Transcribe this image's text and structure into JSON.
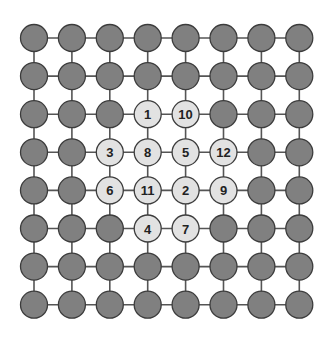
{
  "diagram": {
    "type": "grid-graph",
    "rows": 8,
    "cols": 8,
    "layout": {
      "origin_x": 34,
      "origin_y": 38,
      "step_x": 37.9,
      "step_y": 38.1,
      "node_radius": 13.5
    },
    "colors": {
      "background": "#ffffff",
      "edge": "#555555",
      "node_dark_fill": "#808080",
      "node_light_fill": "#e2e2e2",
      "node_stroke": "#3c3c3c",
      "label": "#222222"
    },
    "labeled_nodes": [
      {
        "row": 2,
        "col": 3,
        "label": "1"
      },
      {
        "row": 2,
        "col": 4,
        "label": "10"
      },
      {
        "row": 3,
        "col": 2,
        "label": "3"
      },
      {
        "row": 3,
        "col": 3,
        "label": "8"
      },
      {
        "row": 3,
        "col": 4,
        "label": "5"
      },
      {
        "row": 3,
        "col": 5,
        "label": "12"
      },
      {
        "row": 4,
        "col": 2,
        "label": "6"
      },
      {
        "row": 4,
        "col": 3,
        "label": "11"
      },
      {
        "row": 4,
        "col": 4,
        "label": "2"
      },
      {
        "row": 4,
        "col": 5,
        "label": "9"
      },
      {
        "row": 5,
        "col": 3,
        "label": "4"
      },
      {
        "row": 5,
        "col": 4,
        "label": "7"
      }
    ]
  }
}
